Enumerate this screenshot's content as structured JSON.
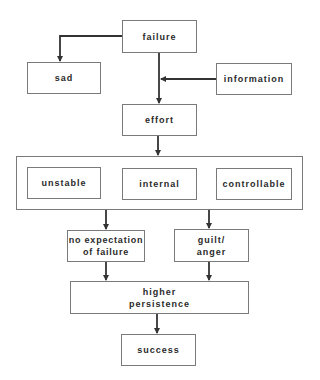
{
  "diagram": {
    "nodes": {
      "failure": {
        "label": "failure"
      },
      "sad": {
        "label": "sad"
      },
      "information": {
        "label": "information"
      },
      "effort": {
        "label": "effort"
      },
      "unstable": {
        "label": "unstable"
      },
      "internal": {
        "label": "internal"
      },
      "controllable": {
        "label": "controllable"
      },
      "no_expectation": {
        "label": "no expectation\nof failure"
      },
      "guilt_anger": {
        "label": "guilt/\nanger"
      },
      "higher_persistence": {
        "label": "higher\npersistence"
      },
      "success": {
        "label": "success"
      }
    },
    "group": {
      "name": "attribution-group",
      "members": [
        "unstable",
        "internal",
        "controllable"
      ]
    },
    "edges": [
      {
        "from": "failure",
        "to": "sad"
      },
      {
        "from": "failure",
        "to": "effort"
      },
      {
        "from": "information",
        "to": "failure-effort-line"
      },
      {
        "from": "effort",
        "to": "attribution-group"
      },
      {
        "from": "attribution-group",
        "to": "no_expectation"
      },
      {
        "from": "attribution-group",
        "to": "guilt_anger"
      },
      {
        "from": "no_expectation",
        "to": "higher_persistence"
      },
      {
        "from": "guilt_anger",
        "to": "higher_persistence"
      },
      {
        "from": "higher_persistence",
        "to": "success"
      }
    ],
    "colors": {
      "line": "#333333",
      "border": "#7a7a7a",
      "text": "#2a2a2a",
      "background": "#ffffff"
    }
  }
}
